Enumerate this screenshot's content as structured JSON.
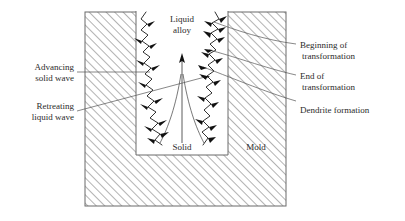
{
  "figure": {
    "labels": {
      "liquid_alloy_line1": "Liquid",
      "liquid_alloy_line2": "alloy",
      "solid": "Solid",
      "mold": "Mold",
      "advancing_line1": "Advancing",
      "advancing_line2": "solid wave",
      "retreating_line1": "Retreating",
      "retreating_line2": "liquid wave",
      "beginning_line1": "Beginning of",
      "beginning_line2": "transformation",
      "end_line1": "End of",
      "end_line2": "transformation",
      "dendrite": "Dendrite formation"
    },
    "colors": {
      "background": "#ffffff",
      "mold_hatch": "#9a9a9a",
      "mold_border": "#6b6b6b",
      "cavity_fill": "#ffffff",
      "wave_stroke": "#1a1a1a",
      "dendrite_fill": "#111111",
      "leader_stroke": "#555555",
      "text": "#2b2b2b"
    },
    "regions": [
      {
        "name": "mold",
        "x": 85,
        "y": 12,
        "width": 201,
        "height": 194,
        "fill": "hatched"
      },
      {
        "name": "cavity",
        "x": 136,
        "y": 12,
        "width": 92,
        "height": 143,
        "fill": "white"
      }
    ]
  }
}
